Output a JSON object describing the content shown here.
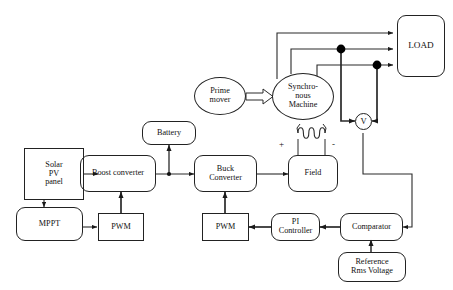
{
  "diagram": {
    "background_color": "#ffffff",
    "line_color": "#222222",
    "junction_color": "#000000",
    "blocks": [
      {
        "id": "solar_pv",
        "label": "Solar\nPV\npanel",
        "shape": "rectangle"
      },
      {
        "id": "mppt",
        "label": "MPPT",
        "shape": "rounded-rectangle"
      },
      {
        "id": "pwm_boost",
        "label": "PWM",
        "shape": "rectangle"
      },
      {
        "id": "boost",
        "label": "Boost converter",
        "shape": "rounded-rectangle"
      },
      {
        "id": "battery",
        "label": "Battery",
        "shape": "rounded-rectangle"
      },
      {
        "id": "buck",
        "label": "Buck\nConverter",
        "shape": "rounded-rectangle"
      },
      {
        "id": "pwm_buck",
        "label": "PWM",
        "shape": "rectangle"
      },
      {
        "id": "pi",
        "label": "PI\nController",
        "shape": "rounded-rectangle"
      },
      {
        "id": "comparator",
        "label": "Comparator",
        "shape": "rounded-rectangle"
      },
      {
        "id": "reference",
        "label": "Reference\nRms Voltage",
        "shape": "rounded-rectangle"
      },
      {
        "id": "field",
        "label": "Field",
        "shape": "rounded-rectangle"
      },
      {
        "id": "prime_mover",
        "label": "Prime\nmover",
        "shape": "ellipse"
      },
      {
        "id": "sync_machine",
        "label": "Synchro-\nnous\nMachine",
        "shape": "ellipse"
      },
      {
        "id": "load",
        "label": "LOAD",
        "shape": "rounded-rectangle"
      },
      {
        "id": "voltmeter",
        "label": "V",
        "shape": "circle"
      }
    ],
    "annotations": {
      "field_positive": "+",
      "field_negative": "-"
    },
    "symbols": {
      "field_winding": "coil-winding",
      "mechanical_coupling": "block-arrow",
      "phase_count": 3
    }
  }
}
